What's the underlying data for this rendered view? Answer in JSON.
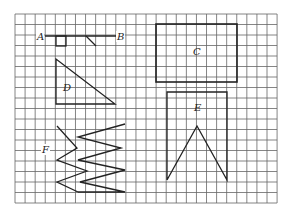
{
  "grid": {
    "left": 15,
    "top": 14,
    "cols": 26,
    "rows": 18,
    "cell_w": 10.08,
    "cell_h": 10.5,
    "line_color": "#555555",
    "figure_color": "#222222"
  },
  "labels": {
    "A": "A",
    "B": "B",
    "C": "C",
    "D": "D",
    "E": "E",
    "F": "F"
  },
  "figures": {
    "segment_AB": {
      "x1": 45,
      "y1": 36,
      "x2": 116,
      "y2": 36
    },
    "small_square": {
      "x": 56,
      "y": 36,
      "w": 10,
      "h": 10
    },
    "small_diagonal": {
      "x1": 86,
      "y1": 36,
      "x2": 96,
      "y2": 46
    },
    "rect_C": {
      "x": 156,
      "y": 24,
      "w": 81,
      "h": 58
    },
    "triangle_D": "56,59 56,104 115,104",
    "shape_E": "167,180 167,92 227,92 227,180 197,126 167,180",
    "zigzag_F_inner": "57,126 77,148 57,160 87,171 57,182 78,192",
    "zigzag_F_outer": "125,124 78,137 121,148 78,160 125,170 80,182 125,192 78,192"
  }
}
